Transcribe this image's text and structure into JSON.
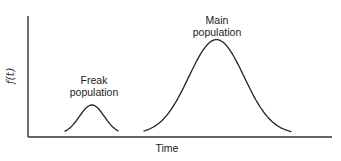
{
  "chart_data": {
    "type": "line",
    "title": "",
    "xlabel": "Time",
    "ylabel": "f(t)",
    "grid": false,
    "legend": null,
    "axis_ticks": false,
    "x_range_px": [
      28,
      332
    ],
    "y_range_px": [
      16,
      137
    ],
    "series": [
      {
        "name": "Freak population",
        "shape": "bell",
        "peak_x_rel": 0.21,
        "peak_height_rel": 0.24,
        "spread_rel": 0.09,
        "start_x_rel": 0.12,
        "end_x_rel": 0.3
      },
      {
        "name": "Main population",
        "shape": "bell",
        "peak_x_rel": 0.62,
        "peak_height_rel": 0.78,
        "spread_rel": 0.2,
        "start_x_rel": 0.38,
        "end_x_rel": 0.87
      }
    ],
    "annotations": [
      {
        "text_lines": [
          "Freak",
          "population"
        ],
        "near_series": "Freak population"
      },
      {
        "text_lines": [
          "Main",
          "population"
        ],
        "near_series": "Main population"
      }
    ]
  },
  "labels": {
    "x_axis": "Time",
    "y_axis": "f(t)",
    "freak_line1": "Freak",
    "freak_line2": "population",
    "main_line1": "Main",
    "main_line2": "population"
  }
}
